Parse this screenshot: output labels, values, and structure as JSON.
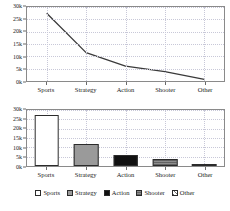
{
  "figure": {
    "background": "#ffffff",
    "axis_color": "#8a8a8a",
    "grid_color": "#c8c8d8",
    "line_color": "#3a3a3a"
  },
  "chart_data": [
    {
      "type": "line",
      "panel": "top",
      "title": "",
      "xlabel": "",
      "ylabel": "",
      "categories": [
        "Sports",
        "Strategy",
        "Action",
        "Shooter",
        "Other"
      ],
      "values": [
        27500,
        11500,
        6000,
        3800,
        700
      ],
      "ytick_labels": [
        "0k",
        "5k",
        "10k",
        "15k",
        "20k",
        "25k",
        "30k"
      ],
      "ytick_values": [
        0,
        5000,
        10000,
        15000,
        20000,
        25000,
        30000
      ],
      "ylim": [
        0,
        30000
      ],
      "grid": true,
      "legend": "none",
      "series": [
        {
          "name": "Global Sales",
          "values": [
            27500,
            11500,
            6000,
            3800,
            700
          ]
        }
      ]
    },
    {
      "type": "bar",
      "panel": "bottom",
      "title": "",
      "xlabel": "",
      "ylabel": "",
      "categories": [
        "Sports",
        "Strategy",
        "Action",
        "Shooter",
        "Other"
      ],
      "values": [
        27500,
        11800,
        6000,
        4000,
        700
      ],
      "bar_colors": [
        "#ffffff",
        "#9a9a9a",
        "#111111",
        "#8d8d8d",
        "#ffffff"
      ],
      "ytick_labels": [
        "0k",
        "5k",
        "10k",
        "15k",
        "20k",
        "25k",
        "30k"
      ],
      "ytick_values": [
        0,
        5000,
        10000,
        15000,
        20000,
        25000,
        30000
      ],
      "ylim": [
        0,
        30000
      ],
      "grid": true,
      "legend": "bottom",
      "legend_entries": [
        {
          "label": "Sports",
          "color": "#ffffff"
        },
        {
          "label": "Strategy",
          "color": "#9a9a9a"
        },
        {
          "label": "Action",
          "color": "#111111"
        },
        {
          "label": "Shooter",
          "color": "#8d8d8d"
        },
        {
          "label": "Other",
          "color": "#ffffff"
        }
      ]
    }
  ],
  "footer": {
    "caption": ""
  }
}
